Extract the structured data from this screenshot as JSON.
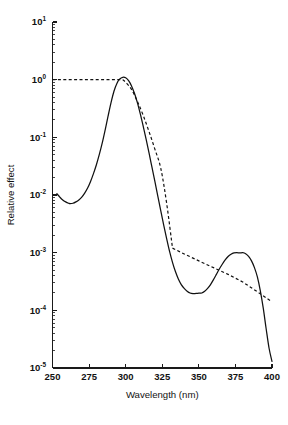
{
  "figure": {
    "background": "#ffffff",
    "ink_color": "#111111"
  },
  "axes": {
    "y_title": "Relative effect",
    "x_title": "Wavelength (nm)",
    "x_ticks": [
      "250",
      "275",
      "300",
      "325",
      "350",
      "375",
      "400"
    ],
    "x_tick_values": [
      250,
      275,
      300,
      325,
      350,
      375,
      400
    ],
    "y_ticks": [
      {
        "mantissa": "10",
        "exponent": "1"
      },
      {
        "mantissa": "10",
        "exponent": "0"
      },
      {
        "mantissa": "10",
        "exponent": "-1"
      },
      {
        "mantissa": "10",
        "exponent": "-2"
      },
      {
        "mantissa": "10",
        "exponent": "-3"
      },
      {
        "mantissa": "10",
        "exponent": "-4"
      },
      {
        "mantissa": "10",
        "exponent": "-5"
      }
    ],
    "y_tick_values": [
      10,
      1,
      0.1,
      0.01,
      0.001,
      0.0001,
      1e-05
    ]
  },
  "chart_data": {
    "type": "line",
    "title": "",
    "xlabel": "Wavelength (nm)",
    "ylabel": "Relative effect",
    "xlim": [
      250,
      400
    ],
    "ylim": [
      1e-05,
      10
    ],
    "yscale": "log",
    "xscale": "linear",
    "grid": false,
    "legend": "none",
    "series": [
      {
        "name": "action spectrum",
        "style": "solid",
        "color": "#111111",
        "x": [
          253,
          255,
          257,
          259,
          261,
          262,
          264,
          266,
          268,
          270,
          272,
          274,
          276,
          278,
          280,
          282,
          284,
          286,
          288,
          290,
          292,
          294,
          296,
          298,
          300,
          302,
          304,
          306,
          308,
          310,
          312,
          314,
          316,
          318,
          320,
          322,
          324,
          326,
          328,
          330,
          332,
          334,
          336,
          338,
          340,
          342,
          344,
          346,
          348,
          350,
          352,
          354,
          356,
          358,
          360,
          362,
          364,
          366,
          368,
          370,
          372,
          374,
          376,
          378,
          380,
          382,
          384,
          386,
          388,
          390,
          392,
          394,
          396,
          398,
          400
        ],
        "y": [
          0.0105,
          0.0092,
          0.0082,
          0.0076,
          0.0072,
          0.0071,
          0.0072,
          0.0076,
          0.0082,
          0.0092,
          0.0108,
          0.0132,
          0.0172,
          0.0235,
          0.0335,
          0.0505,
          0.08,
          0.135,
          0.235,
          0.4,
          0.63,
          0.86,
          1.03,
          1.1,
          1.08,
          0.96,
          0.78,
          0.58,
          0.4,
          0.255,
          0.155,
          0.092,
          0.053,
          0.03,
          0.017,
          0.0095,
          0.0053,
          0.003,
          0.00175,
          0.00105,
          0.00068,
          0.00047,
          0.00035,
          0.00028,
          0.00024,
          0.000215,
          0.0002,
          0.000195,
          0.000196,
          0.000198,
          0.0002,
          0.000215,
          0.00024,
          0.00028,
          0.00034,
          0.00042,
          0.00052,
          0.00063,
          0.00075,
          0.00086,
          0.00094,
          0.00099,
          0.001,
          0.00099,
          0.001,
          0.00096,
          0.00086,
          0.00072,
          0.00055,
          0.00038,
          0.00022,
          0.00011,
          4.8e-05,
          2.2e-05,
          1.3e-05
        ]
      },
      {
        "name": "reference envelope",
        "style": "dashed",
        "color": "#111111",
        "x": [
          250,
          298,
          300,
          304,
          308,
          312,
          316,
          320,
          324,
          328,
          332,
          340,
          350,
          360,
          370,
          380,
          390,
          400
        ],
        "y": [
          1.0,
          1.0,
          0.9,
          0.68,
          0.42,
          0.24,
          0.125,
          0.062,
          0.029,
          0.0072,
          0.0012,
          0.00095,
          0.00072,
          0.00055,
          0.00042,
          0.00031,
          0.00021,
          0.00014
        ]
      }
    ],
    "annotations": [
      {
        "text": "peak",
        "x": 298,
        "y": 1.1
      },
      {
        "text": "local minimum",
        "x": 262,
        "y": 0.0071
      },
      {
        "text": "valley",
        "x": 352,
        "y": 0.0002
      },
      {
        "text": "secondary peak",
        "x": 380,
        "y": 0.001
      }
    ]
  }
}
